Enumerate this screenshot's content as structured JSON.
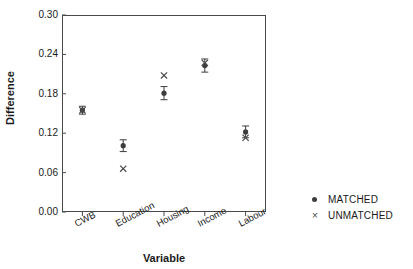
{
  "chart_data": {
    "type": "scatter",
    "title": "",
    "xlabel": "Variable",
    "ylabel": "Difference",
    "categories": [
      "CWB",
      "Education",
      "Housing",
      "Income",
      "Labour"
    ],
    "ylim": [
      0.0,
      0.3
    ],
    "yticks": [
      "0.00",
      "0.06",
      "0.12",
      "0.18",
      "0.24",
      "0.30"
    ],
    "ytick_values": [
      0.0,
      0.06,
      0.12,
      0.18,
      0.24,
      0.3
    ],
    "grid": false,
    "legend_position": "right",
    "series": [
      {
        "name": "MATCHED",
        "marker": "filled-circle",
        "color": "#3d3d3d",
        "values": [
          0.155,
          0.101,
          0.181,
          0.223,
          0.122
        ],
        "errors": [
          0.006,
          0.009,
          0.01,
          0.01,
          0.009
        ]
      },
      {
        "name": "UNMATCHED",
        "marker": "cross",
        "color": "#4a4a4a",
        "values": [
          0.155,
          0.066,
          0.208,
          0.227,
          0.113
        ],
        "errors": [
          0,
          0,
          0,
          0,
          0
        ]
      }
    ]
  },
  "legend": {
    "items": [
      {
        "label": "MATCHED",
        "marker": "filled-circle"
      },
      {
        "label": "UNMATCHED",
        "marker": "cross"
      }
    ]
  },
  "axes": {
    "y_label": "Difference",
    "x_label": "Variable"
  }
}
